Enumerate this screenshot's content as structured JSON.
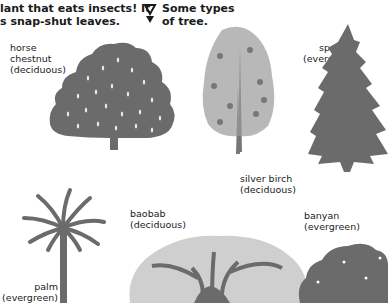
{
  "intro_text": {
    "line1": "lant that eats insects! It",
    "line2": "s snap-shut leaves."
  },
  "section_heading": {
    "icon": "double-triangle-pointer-icon",
    "line1": "Some types",
    "line2": "of tree."
  },
  "trees": [
    {
      "name": "horse",
      "name2": "chestnut",
      "type": "(deciduous)"
    },
    {
      "name": "silver birch",
      "type": "(deciduous)"
    },
    {
      "name": "spruce",
      "type": "(evergreen)"
    },
    {
      "name": "palm",
      "type": "(evergreen)"
    },
    {
      "name": "baobab",
      "type": "(deciduous)"
    },
    {
      "name": "banyan",
      "type": "(evergreen)"
    }
  ],
  "colors": {
    "silhouette": "#6b6b6b",
    "text": "#1a1a1a",
    "background": "#ffffff"
  }
}
